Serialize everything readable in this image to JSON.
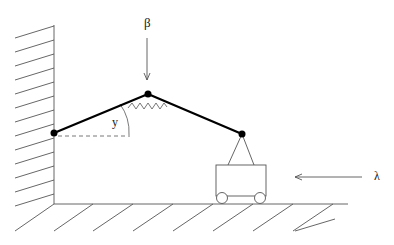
{
  "diagram": {
    "type": "mechanism",
    "labels": {
      "load_top": "β",
      "angle": "y",
      "load_side": "λ"
    },
    "colors": {
      "bars": "#000000",
      "thin": "#555555",
      "background": "#ffffff"
    },
    "joints": [
      {
        "name": "wall-joint",
        "x": 54,
        "y": 133
      },
      {
        "name": "top-joint",
        "x": 148,
        "y": 94
      },
      {
        "name": "cart-joint",
        "x": 242,
        "y": 134
      }
    ]
  }
}
